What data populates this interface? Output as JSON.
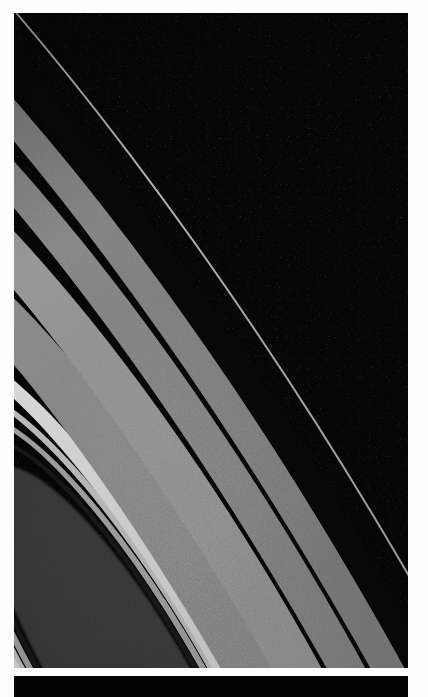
{
  "page": {
    "background_color": "#fdfdfd",
    "width": 428,
    "height": 697
  },
  "plate": {
    "name": "saturn-rings-photograph",
    "caption": "",
    "sky_color": "#050505",
    "frame_color": "#ffffff",
    "left": 14,
    "top": 13,
    "width": 394,
    "height": 655,
    "ring_tilt_degrees": -31
  },
  "rings": [
    {
      "id": "f-ring",
      "label": "F Ring",
      "brightness": "bright-thin",
      "color": "#b9b9b9",
      "width_px": 2,
      "rx": 300,
      "ry": 1150
    },
    {
      "id": "roche-gap",
      "label": "Roche Division",
      "brightness": "dark",
      "color": "#080808",
      "width_px": 26,
      "rx": 276,
      "ry": 1060
    },
    {
      "id": "a-ring-outer",
      "label": "A Ring (outer)",
      "brightness": "mid",
      "color": "#8e8e8e",
      "width_px": 30,
      "rx": 250,
      "ry": 958
    },
    {
      "id": "encke-gap",
      "label": "Encke Gap",
      "brightness": "dark-line",
      "color": "#4a4a4a",
      "width_px": 3,
      "rx": 232,
      "ry": 890
    },
    {
      "id": "a-ring-inner",
      "label": "A Ring (inner)",
      "brightness": "mid",
      "color": "#8a8a8a",
      "width_px": 34,
      "rx": 216,
      "ry": 828
    },
    {
      "id": "cassini-division",
      "label": "Cassini Division",
      "brightness": "very-dark",
      "color": "#151515",
      "width_px": 7,
      "rx": 196,
      "ry": 752
    },
    {
      "id": "b-ring-outer",
      "label": "B Ring (outer)",
      "brightness": "mid-bright",
      "color": "#9a9a9a",
      "width_px": 44,
      "rx": 178,
      "ry": 682
    },
    {
      "id": "b-ring-mid",
      "label": "B Ring (middle)",
      "brightness": "mid",
      "color": "#909090",
      "width_px": 52,
      "rx": 142,
      "ry": 545
    },
    {
      "id": "b-ring-dark-band",
      "label": "B Ring dark band",
      "brightness": "dark",
      "color": "#3c3c3c",
      "width_px": 8,
      "rx": 112,
      "ry": 430
    },
    {
      "id": "b-ring-bright",
      "label": "B Ring bright zone",
      "brightness": "brightest",
      "color": "#e6e6e6",
      "width_px": 16,
      "rx": 100,
      "ry": 384
    },
    {
      "id": "b-ring-inner-1",
      "label": "B Ring inner band",
      "brightness": "bright",
      "color": "#c8c8c8",
      "width_px": 7,
      "rx": 86,
      "ry": 330
    },
    {
      "id": "b-ring-inner-2",
      "label": "B Ring inner band",
      "brightness": "mid-bright",
      "color": "#a8a8a8",
      "width_px": 6,
      "rx": 78,
      "ry": 300
    },
    {
      "id": "c-ring-edge",
      "label": "C Ring outer edge",
      "brightness": "dark-line",
      "color": "#1a1a1a",
      "width_px": 5,
      "rx": 71,
      "ry": 272
    },
    {
      "id": "c-ring",
      "label": "C Ring (grainy)",
      "brightness": "dark-grainy",
      "color": "#3a3a3a",
      "width_px": 64,
      "rx": 62,
      "ry": 238
    }
  ],
  "strip": {
    "name": "lower-black-strip",
    "color": "#030303",
    "left": 14,
    "top": 676,
    "width": 394,
    "height": 21
  },
  "gutter": {
    "name": "white-gutter",
    "color": "#ffffff",
    "height": 8
  },
  "subject": {
    "body": "Saturn",
    "feature": "ring system",
    "view": "oblique high-phase view of the rings sweeping from upper-left apex to lower-right",
    "image_type": "grayscale spacecraft photograph"
  }
}
